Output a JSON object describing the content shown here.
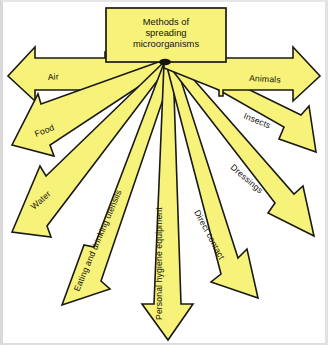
{
  "diagram": {
    "type": "radial-arrow-diagram",
    "title": "Methods of spreading microorganisms",
    "title_lines": [
      "Methods of",
      "spreading",
      "microorganisms"
    ],
    "colors": {
      "arrow_fill": "#f7f279",
      "arrow_fill_alt": "#f5ef70",
      "arrow_stroke": "#1a1a14",
      "background": "#ffffff",
      "frame": "#dedede",
      "text": "#15150e"
    },
    "center_box": {
      "label": "Methods of spreading microorganisms",
      "x": 106,
      "y": 8,
      "width": 120,
      "height": 56
    },
    "origin": {
      "x": 164,
      "y": 63
    },
    "arrow_count": 9,
    "arrows": [
      {
        "id": "air",
        "label": "Air",
        "angle_deg": 181,
        "tip": {
          "x": 8,
          "y": 76
        },
        "side": "left",
        "label_rotation": -6
      },
      {
        "id": "food",
        "label": "Food",
        "angle_deg": 196,
        "tip": {
          "x": 12,
          "y": 145
        },
        "side": "left",
        "label_rotation": -20
      },
      {
        "id": "water",
        "label": "Water",
        "angle_deg": 212,
        "tip": {
          "x": 12,
          "y": 232
        },
        "side": "left",
        "label_rotation": -42
      },
      {
        "id": "eating-and-drinking-utensils",
        "label": "Eating and drinking utensils",
        "angle_deg": 232,
        "tip": {
          "x": 62,
          "y": 305
        },
        "side": "left",
        "label_rotation": -66
      },
      {
        "id": "personal-hygiene-equipment",
        "label": "Personal hygiene equipment",
        "angle_deg": 270,
        "tip": {
          "x": 168,
          "y": 340
        },
        "side": "center",
        "label_rotation": -90
      },
      {
        "id": "direct-contact",
        "label": "Direct contact",
        "angle_deg": 309,
        "tip": {
          "x": 258,
          "y": 298
        },
        "side": "right",
        "label_rotation": 62
      },
      {
        "id": "dressings",
        "label": "Dressings",
        "angle_deg": 329,
        "tip": {
          "x": 314,
          "y": 236
        },
        "side": "right",
        "label_rotation": 40
      },
      {
        "id": "insects",
        "label": "Insects",
        "angle_deg": 344,
        "tip": {
          "x": 316,
          "y": 152
        },
        "side": "right",
        "label_rotation": 21
      },
      {
        "id": "animals",
        "label": "Animals",
        "angle_deg": 359,
        "tip": {
          "x": 320,
          "y": 76
        },
        "side": "right",
        "label_rotation": 4
      }
    ]
  }
}
